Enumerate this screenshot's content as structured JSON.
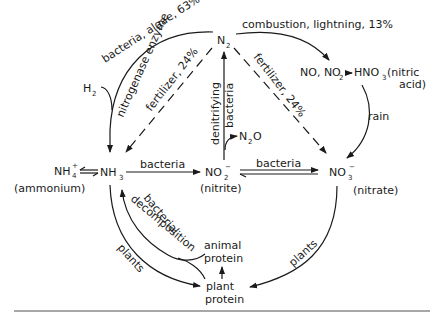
{
  "diagram": {
    "nodes": {
      "n2": {
        "base": "N",
        "sub": "2"
      },
      "h2": {
        "base": "H",
        "sub": "2"
      },
      "nox": {
        "label": "NO, NO",
        "sub": "2"
      },
      "hno3": {
        "base": "HNO",
        "sub": "3",
        "note": "(nitric",
        "note2": "acid)"
      },
      "n2o": {
        "base": "N",
        "sub": "2",
        "tail": "O"
      },
      "nh4": {
        "base": "NH",
        "sub": "4",
        "sup": "+",
        "note": "(ammonium)"
      },
      "nh3": {
        "base": "NH",
        "sub": "3"
      },
      "no2": {
        "base": "NO",
        "sub": "2",
        "sup": "−",
        "note": "(nitrite)"
      },
      "no3": {
        "base": "NO",
        "sub": "3",
        "sup": "−",
        "note": "(nitrate)"
      },
      "animal_protein": {
        "line1": "animal",
        "line2": "protein"
      },
      "plant_protein": {
        "line1": "plant",
        "line2": "protein"
      }
    },
    "edges": {
      "bacteria_algae": "bacteria, algae, 63%",
      "nitrogenase": "nitrogenase enzyme",
      "fertilizer_left": "fertilizer, 24%",
      "fertilizer_right": "fertilizer, 24%",
      "combustion": "combustion, lightning, 13%",
      "rain": "rain",
      "denitrifying1": "denitrifying",
      "denitrifying2": "bacteria",
      "bacteria_nh3_no2": "bacteria",
      "bacteria_no2_no3": "bacteria",
      "bacterial": "bacterial",
      "decomposition": "decomposition",
      "plants_left": "plants",
      "plants_right": "plants"
    }
  }
}
